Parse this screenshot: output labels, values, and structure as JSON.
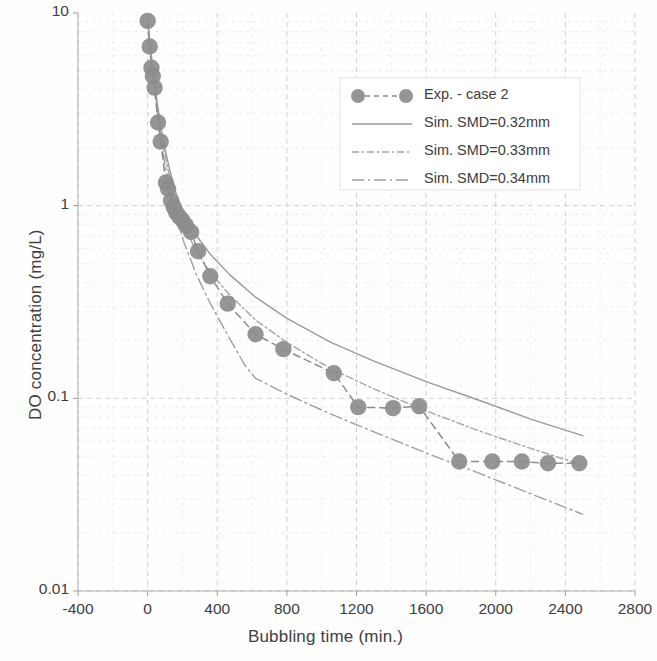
{
  "chart_data": {
    "type": "scatter",
    "title": "",
    "xlabel": "Bubbling time (min.)",
    "ylabel": "DO concentration (mg/L)",
    "xlim": [
      -400,
      2800
    ],
    "ylim": [
      0.01,
      10
    ],
    "yscale": "log",
    "xscale": "linear",
    "grid": true,
    "legend_position": "upper right",
    "xticks": [
      "-400",
      "0",
      "400",
      "800",
      "1200",
      "1600",
      "2000",
      "2400",
      "2800"
    ],
    "xtick_values": [
      -400,
      0,
      400,
      800,
      1200,
      1600,
      2000,
      2400,
      2800
    ],
    "yticks": [
      "10",
      "1",
      "0.1",
      "0.01"
    ],
    "ytick_values": [
      10,
      1,
      0.1,
      0.01
    ],
    "marker_color": "#8c8c8c",
    "line_color": "#9a9a9a",
    "series": [
      {
        "name": "Exp. - case 2",
        "style": "dashed-line-with-circle-markers",
        "marker": "circle",
        "color": "#8c8c8c",
        "x": [
          0,
          12,
          22,
          30,
          40,
          60,
          75,
          105,
          118,
          135,
          150,
          165,
          180,
          200,
          220,
          250,
          290,
          360,
          460,
          620,
          780,
          1070,
          1210,
          1410,
          1560,
          1790,
          1980,
          2150,
          2300,
          2480
        ],
        "y": [
          9.1,
          6.7,
          5.2,
          4.7,
          4.1,
          2.7,
          2.15,
          1.32,
          1.22,
          1.06,
          0.98,
          0.92,
          0.88,
          0.84,
          0.79,
          0.73,
          0.58,
          0.43,
          0.31,
          0.215,
          0.18,
          0.135,
          0.09,
          0.089,
          0.091,
          0.047,
          0.047,
          0.047,
          0.046,
          0.046
        ]
      },
      {
        "name": "Sim. SMD=0.32mm",
        "style": "solid",
        "color": "#9a9a9a",
        "x": [
          0,
          40,
          90,
          150,
          210,
          280,
          360,
          470,
          620,
          800,
          1050,
          1300,
          1600,
          1900,
          2200,
          2500
        ],
        "y": [
          9.1,
          4.2,
          2.15,
          1.25,
          0.9,
          0.7,
          0.56,
          0.44,
          0.335,
          0.26,
          0.196,
          0.156,
          0.122,
          0.098,
          0.078,
          0.064
        ]
      },
      {
        "name": "Sim. SMD=0.33mm",
        "style": "dash-dot",
        "color": "#a5a5a5",
        "x": [
          0,
          40,
          90,
          150,
          210,
          280,
          360,
          470,
          620,
          800,
          1050,
          1300,
          1600,
          1900,
          2200,
          2500
        ],
        "y": [
          9.1,
          4.1,
          2.0,
          1.12,
          0.78,
          0.58,
          0.45,
          0.345,
          0.255,
          0.195,
          0.143,
          0.112,
          0.086,
          0.068,
          0.055,
          0.045
        ]
      },
      {
        "name": "Sim. SMD=0.34mm",
        "style": "dash-dot-long",
        "color": "#9f9f9f",
        "x": [
          0,
          40,
          90,
          150,
          210,
          280,
          360,
          470,
          560,
          620,
          800,
          1050,
          1300,
          1600,
          1900,
          2200,
          2500
        ],
        "y": [
          9.1,
          3.9,
          1.82,
          0.97,
          0.64,
          0.44,
          0.31,
          0.205,
          0.148,
          0.127,
          0.105,
          0.083,
          0.067,
          0.052,
          0.041,
          0.032,
          0.025
        ]
      }
    ],
    "legend": [
      {
        "label": "Exp. - case 2",
        "marker": "circle",
        "line": "dashed"
      },
      {
        "label": "Sim. SMD=0.32mm",
        "marker": "none",
        "line": "solid"
      },
      {
        "label": "Sim. SMD=0.33mm",
        "marker": "none",
        "line": "dash-dot"
      },
      {
        "label": "Sim. SMD=0.34mm",
        "marker": "none",
        "line": "dash-dot-long"
      }
    ]
  }
}
